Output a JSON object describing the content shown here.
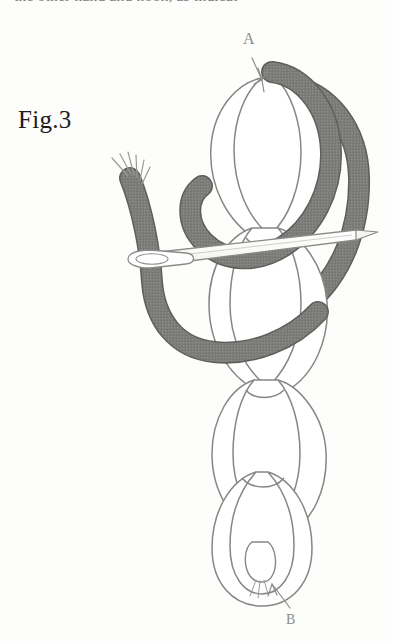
{
  "page": {
    "background_color": "#fdfdfc",
    "width": 393,
    "height": 641
  },
  "cut_text": {
    "partial_line": "the other hand and hook, as indicat"
  },
  "figure": {
    "caption": "Fig.3",
    "title_note": "crochet chain stitch diagram with tapestry needle",
    "labels": [
      {
        "id": "A",
        "text": "A",
        "position": "top",
        "arrow": "down"
      },
      {
        "id": "B",
        "text": "B",
        "position": "bottom",
        "arrow": "up"
      }
    ],
    "colors": {
      "dark_yarn": "#7d7d7a",
      "dark_yarn_edge": "#5e5e5c",
      "light_yarn_fill": "#ffffff",
      "light_yarn_stroke": "#868684",
      "needle_fill": "#fbfbf9",
      "needle_stroke": "#8a8a88",
      "label_color": "#8d8d8a",
      "caption_color": "#1c1c1c"
    },
    "elements": {
      "dark_yarn_label": "shaded working yarn",
      "frayed_end_label": "frayed yarn tip",
      "needle_label": "tapestry needle",
      "needle_eye_label": "needle eye",
      "chain_loops_label": "chain stitch loops"
    }
  }
}
